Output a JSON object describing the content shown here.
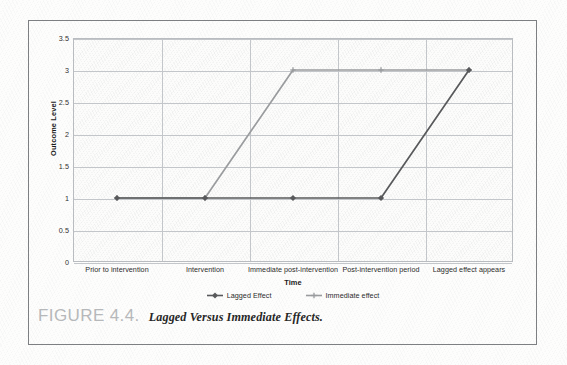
{
  "figure": {
    "caption_number": "FIGURE 4.4.",
    "caption_title": "Lagged Versus Immediate Effects."
  },
  "chart_data": {
    "type": "line",
    "title": "",
    "xlabel": "Time",
    "ylabel": "Outcome Level",
    "categories": [
      "Prior to intervention",
      "Intervention",
      "Immediate post-intervention",
      "Post-intervention period",
      "Lagged effect appears"
    ],
    "series": [
      {
        "name": "Lagged Effect",
        "values": [
          1,
          1,
          1,
          1,
          3
        ],
        "color": "#58595b",
        "marker": "diamond"
      },
      {
        "name": "Immediate effect",
        "values": [
          1,
          1,
          3,
          3,
          3
        ],
        "color": "#9a9c9e",
        "marker": "plus"
      }
    ],
    "ylim": [
      0,
      3.5
    ],
    "yticks": [
      "0",
      "0.5",
      "1",
      "1.5",
      "2",
      "2.5",
      "3",
      "3.5"
    ],
    "ytick_values": [
      0,
      0.5,
      1,
      1.5,
      2,
      2.5,
      3,
      3.5
    ],
    "grid": {
      "horizontal": true,
      "vertical": true
    },
    "legend": {
      "position": "bottom",
      "entries": [
        "Lagged Effect",
        "Immediate effect"
      ]
    },
    "plot_background": "#fcfcfb",
    "grid_color": "#c3c6ca"
  }
}
